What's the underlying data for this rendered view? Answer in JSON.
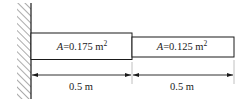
{
  "diagram": {
    "type": "stepped bar fixed to wall",
    "wall": {
      "label": "fixed-support"
    },
    "segments": [
      {
        "area_symbol": "A",
        "area_value": "=0.175 m",
        "area_exp": "2",
        "length_label": "0.5 m"
      },
      {
        "area_symbol": "A",
        "area_value": "=0.125 m",
        "area_exp": "2",
        "length_label": "0.5 m"
      }
    ],
    "colors": {
      "stroke": "#1a1a1a",
      "extension": "#b0b0b0",
      "background": "#ffffff"
    }
  }
}
